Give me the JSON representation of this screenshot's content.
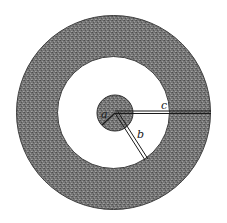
{
  "diagram": {
    "type": "concentric-spheres-cross-section",
    "center": {
      "x": 113.5,
      "y": 112.5
    },
    "regions": [
      {
        "name": "outer-shell",
        "inner_radius": 56,
        "outer_radius": 97,
        "fill": "#6e6e6e"
      },
      {
        "name": "gap",
        "inner_radius": 18,
        "outer_radius": 56,
        "fill": "#ffffff"
      },
      {
        "name": "core",
        "radius": 18,
        "fill": "#7a7a7a"
      }
    ],
    "radii": [
      {
        "label": "a",
        "length": 18,
        "angle_deg": 140,
        "label_pos": {
          "x": 103,
          "y": 117
        }
      },
      {
        "label": "b",
        "length": 56,
        "angle_deg": 58,
        "label_pos": {
          "x": 138,
          "y": 137
        }
      },
      {
        "label": "c",
        "length": 97,
        "angle_deg": 0,
        "label_pos": {
          "x": 162,
          "y": 109
        }
      }
    ],
    "colors": {
      "shade": "#6e6e6e",
      "shade_dark": "#4a4a4a",
      "line": "#1a1a1a",
      "background": "#ffffff"
    }
  }
}
